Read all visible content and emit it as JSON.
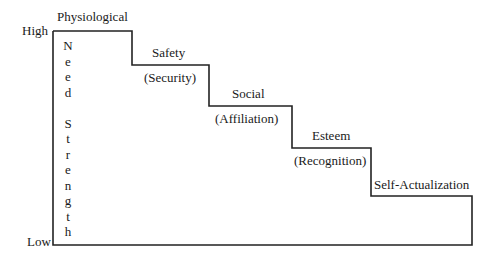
{
  "axis": {
    "high_label": "High",
    "low_label": "Low",
    "vertical_label": "Need Strength",
    "vertical_letters": [
      "N",
      "e",
      "e",
      "d",
      "",
      "S",
      "t",
      "r",
      "e",
      "n",
      "g",
      "t",
      "h"
    ]
  },
  "steps": [
    {
      "name": "Physiological",
      "subtitle": ""
    },
    {
      "name": "Safety",
      "subtitle": "(Security)"
    },
    {
      "name": "Social",
      "subtitle": "(Affiliation)"
    },
    {
      "name": "Esteem",
      "subtitle": "(Recognition)"
    },
    {
      "name": "Self-Actualization",
      "subtitle": ""
    }
  ],
  "colors": {
    "line": "#222222",
    "text": "#1a1a1a",
    "background": "#ffffff"
  }
}
